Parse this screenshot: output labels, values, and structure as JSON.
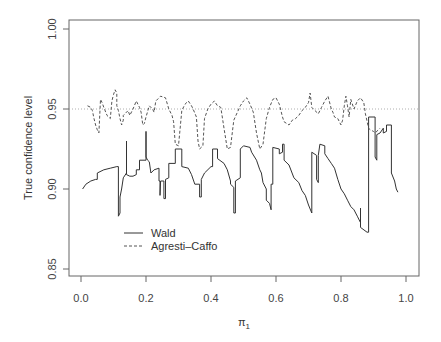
{
  "chart_data": {
    "type": "line",
    "title": "",
    "xlabel": "π1",
    "xlabel_main": "π",
    "xlabel_sub": "1",
    "ylabel": "True confidence level",
    "xlim": [
      0.0,
      1.0
    ],
    "ylim": [
      0.85,
      1.0
    ],
    "x_ticks": [
      "0.0",
      "0.2",
      "0.4",
      "0.6",
      "0.8",
      "1.0"
    ],
    "y_ticks": [
      "0.85",
      "0.90",
      "0.95",
      "1.00"
    ],
    "reference_line": {
      "y": 0.95,
      "style": "dotted"
    },
    "grid": false,
    "legend_position": "inside bottom-left",
    "legend": [
      {
        "label": "Wald",
        "style": "solid"
      },
      {
        "label": "Agresti–Caffo",
        "style": "dashed"
      }
    ],
    "series": [
      {
        "name": "Wald",
        "style": "solid",
        "color": "#333333",
        "points": [
          [
            0.005,
            0.9
          ],
          [
            0.015,
            0.903
          ],
          [
            0.03,
            0.905
          ],
          [
            0.045,
            0.906
          ],
          [
            0.05,
            0.906
          ],
          [
            0.05,
            0.91
          ],
          [
            0.07,
            0.912
          ],
          [
            0.09,
            0.913
          ],
          [
            0.11,
            0.914
          ],
          [
            0.115,
            0.914
          ],
          [
            0.115,
            0.883
          ],
          [
            0.12,
            0.885
          ],
          [
            0.12,
            0.895
          ],
          [
            0.125,
            0.9
          ],
          [
            0.13,
            0.907
          ],
          [
            0.14,
            0.91
          ],
          [
            0.14,
            0.93
          ],
          [
            0.14,
            0.909
          ],
          [
            0.15,
            0.908
          ],
          [
            0.16,
            0.908
          ],
          [
            0.17,
            0.909
          ],
          [
            0.17,
            0.912
          ],
          [
            0.18,
            0.912
          ],
          [
            0.18,
            0.918
          ],
          [
            0.2,
            0.918
          ],
          [
            0.2,
            0.936
          ],
          [
            0.2,
            0.92
          ],
          [
            0.205,
            0.918
          ],
          [
            0.21,
            0.917
          ],
          [
            0.215,
            0.91
          ],
          [
            0.225,
            0.912
          ],
          [
            0.24,
            0.913
          ],
          [
            0.24,
            0.905
          ],
          [
            0.243,
            0.905
          ],
          [
            0.243,
            0.896
          ],
          [
            0.245,
            0.905
          ],
          [
            0.255,
            0.905
          ],
          [
            0.255,
            0.894
          ],
          [
            0.26,
            0.894
          ],
          [
            0.26,
            0.906
          ],
          [
            0.27,
            0.907
          ],
          [
            0.27,
            0.916
          ],
          [
            0.29,
            0.916
          ],
          [
            0.29,
            0.925
          ],
          [
            0.31,
            0.925
          ],
          [
            0.31,
            0.914
          ],
          [
            0.33,
            0.913
          ],
          [
            0.34,
            0.909
          ],
          [
            0.35,
            0.903
          ],
          [
            0.365,
            0.903
          ],
          [
            0.365,
            0.895
          ],
          [
            0.37,
            0.895
          ],
          [
            0.37,
            0.906
          ],
          [
            0.38,
            0.91
          ],
          [
            0.4,
            0.914
          ],
          [
            0.405,
            0.914
          ],
          [
            0.405,
            0.925
          ],
          [
            0.42,
            0.925
          ],
          [
            0.42,
            0.919
          ],
          [
            0.44,
            0.916
          ],
          [
            0.45,
            0.912
          ],
          [
            0.46,
            0.905
          ],
          [
            0.46,
            0.903
          ],
          [
            0.47,
            0.901
          ],
          [
            0.47,
            0.885
          ],
          [
            0.475,
            0.885
          ],
          [
            0.475,
            0.905
          ],
          [
            0.49,
            0.907
          ],
          [
            0.49,
            0.925
          ],
          [
            0.5,
            0.927
          ],
          [
            0.52,
            0.926
          ],
          [
            0.525,
            0.923
          ],
          [
            0.54,
            0.918
          ],
          [
            0.55,
            0.912
          ],
          [
            0.555,
            0.91
          ],
          [
            0.56,
            0.904
          ],
          [
            0.57,
            0.9
          ],
          [
            0.57,
            0.893
          ],
          [
            0.58,
            0.891
          ],
          [
            0.585,
            0.887
          ],
          [
            0.585,
            0.903
          ],
          [
            0.59,
            0.903
          ],
          [
            0.59,
            0.926
          ],
          [
            0.61,
            0.925
          ],
          [
            0.61,
            0.922
          ],
          [
            0.62,
            0.923
          ],
          [
            0.62,
            0.928
          ],
          [
            0.625,
            0.928
          ],
          [
            0.625,
            0.918
          ],
          [
            0.64,
            0.915
          ],
          [
            0.655,
            0.907
          ],
          [
            0.67,
            0.904
          ],
          [
            0.68,
            0.899
          ],
          [
            0.69,
            0.896
          ],
          [
            0.7,
            0.89
          ],
          [
            0.71,
            0.885
          ],
          [
            0.71,
            0.923
          ],
          [
            0.725,
            0.921
          ],
          [
            0.725,
            0.906
          ],
          [
            0.73,
            0.904
          ],
          [
            0.73,
            0.921
          ],
          [
            0.735,
            0.928
          ],
          [
            0.75,
            0.927
          ],
          [
            0.75,
            0.922
          ],
          [
            0.76,
            0.919
          ],
          [
            0.77,
            0.916
          ],
          [
            0.78,
            0.913
          ],
          [
            0.79,
            0.906
          ],
          [
            0.8,
            0.9
          ],
          [
            0.81,
            0.897
          ],
          [
            0.82,
            0.893
          ],
          [
            0.83,
            0.889
          ],
          [
            0.84,
            0.887
          ],
          [
            0.85,
            0.883
          ],
          [
            0.86,
            0.879
          ],
          [
            0.86,
            0.888
          ],
          [
            0.86,
            0.876
          ],
          [
            0.88,
            0.873
          ],
          [
            0.885,
            0.873
          ],
          [
            0.885,
            0.945
          ],
          [
            0.905,
            0.945
          ],
          [
            0.905,
            0.92
          ],
          [
            0.91,
            0.918
          ],
          [
            0.91,
            0.934
          ],
          [
            0.92,
            0.935
          ],
          [
            0.93,
            0.938
          ],
          [
            0.93,
            0.935
          ],
          [
            0.94,
            0.936
          ],
          [
            0.94,
            0.94
          ],
          [
            0.955,
            0.94
          ],
          [
            0.955,
            0.91
          ],
          [
            0.965,
            0.905
          ],
          [
            0.97,
            0.9
          ],
          [
            0.975,
            0.898
          ]
        ]
      },
      {
        "name": "Agresti–Caffo",
        "style": "dashed",
        "color": "#555555",
        "points": [
          [
            0.02,
            0.952
          ],
          [
            0.03,
            0.951
          ],
          [
            0.035,
            0.949
          ],
          [
            0.04,
            0.944
          ],
          [
            0.045,
            0.94
          ],
          [
            0.05,
            0.937
          ],
          [
            0.055,
            0.935
          ],
          [
            0.06,
            0.956
          ],
          [
            0.065,
            0.954
          ],
          [
            0.07,
            0.951
          ],
          [
            0.08,
            0.946
          ],
          [
            0.09,
            0.944
          ],
          [
            0.095,
            0.955
          ],
          [
            0.1,
            0.959
          ],
          [
            0.105,
            0.962
          ],
          [
            0.11,
            0.96
          ],
          [
            0.11,
            0.952
          ],
          [
            0.115,
            0.949
          ],
          [
            0.12,
            0.944
          ],
          [
            0.125,
            0.94
          ],
          [
            0.13,
            0.943
          ],
          [
            0.13,
            0.946
          ],
          [
            0.14,
            0.948
          ],
          [
            0.145,
            0.949
          ],
          [
            0.15,
            0.946
          ],
          [
            0.16,
            0.95
          ],
          [
            0.17,
            0.955
          ],
          [
            0.18,
            0.951
          ],
          [
            0.185,
            0.948
          ],
          [
            0.19,
            0.94
          ],
          [
            0.195,
            0.941
          ],
          [
            0.2,
            0.945
          ],
          [
            0.21,
            0.952
          ],
          [
            0.22,
            0.95
          ],
          [
            0.225,
            0.948
          ],
          [
            0.23,
            0.955
          ],
          [
            0.245,
            0.958
          ],
          [
            0.26,
            0.957
          ],
          [
            0.27,
            0.95
          ],
          [
            0.28,
            0.946
          ],
          [
            0.285,
            0.942
          ],
          [
            0.29,
            0.928
          ],
          [
            0.3,
            0.927
          ],
          [
            0.31,
            0.949
          ],
          [
            0.32,
            0.953
          ],
          [
            0.33,
            0.955
          ],
          [
            0.34,
            0.952
          ],
          [
            0.345,
            0.95
          ],
          [
            0.355,
            0.945
          ],
          [
            0.36,
            0.93
          ],
          [
            0.365,
            0.925
          ],
          [
            0.375,
            0.927
          ],
          [
            0.38,
            0.944
          ],
          [
            0.39,
            0.95
          ],
          [
            0.4,
            0.953
          ],
          [
            0.41,
            0.955
          ],
          [
            0.42,
            0.952
          ],
          [
            0.43,
            0.951
          ],
          [
            0.44,
            0.938
          ],
          [
            0.45,
            0.925
          ],
          [
            0.46,
            0.926
          ],
          [
            0.47,
            0.943
          ],
          [
            0.49,
            0.952
          ],
          [
            0.5,
            0.955
          ],
          [
            0.51,
            0.957
          ],
          [
            0.52,
            0.953
          ],
          [
            0.53,
            0.948
          ],
          [
            0.54,
            0.935
          ],
          [
            0.55,
            0.925
          ],
          [
            0.56,
            0.928
          ],
          [
            0.57,
            0.944
          ],
          [
            0.58,
            0.951
          ],
          [
            0.59,
            0.956
          ],
          [
            0.6,
            0.957
          ],
          [
            0.61,
            0.953
          ],
          [
            0.62,
            0.945
          ],
          [
            0.625,
            0.942
          ],
          [
            0.64,
            0.94
          ],
          [
            0.65,
            0.943
          ],
          [
            0.66,
            0.944
          ],
          [
            0.67,
            0.946
          ],
          [
            0.68,
            0.949
          ],
          [
            0.69,
            0.951
          ],
          [
            0.7,
            0.954
          ],
          [
            0.705,
            0.96
          ],
          [
            0.71,
            0.951
          ],
          [
            0.72,
            0.949
          ],
          [
            0.73,
            0.947
          ],
          [
            0.74,
            0.951
          ],
          [
            0.75,
            0.955
          ],
          [
            0.76,
            0.958
          ],
          [
            0.77,
            0.95
          ],
          [
            0.775,
            0.948
          ],
          [
            0.78,
            0.945
          ],
          [
            0.79,
            0.944
          ],
          [
            0.8,
            0.94
          ],
          [
            0.805,
            0.943
          ],
          [
            0.81,
            0.952
          ],
          [
            0.815,
            0.958
          ],
          [
            0.82,
            0.952
          ],
          [
            0.825,
            0.945
          ],
          [
            0.83,
            0.956
          ],
          [
            0.84,
            0.95
          ],
          [
            0.85,
            0.955
          ],
          [
            0.86,
            0.957
          ],
          [
            0.87,
            0.954
          ],
          [
            0.875,
            0.947
          ],
          [
            0.885,
            0.938
          ],
          [
            0.89,
            0.937
          ],
          [
            0.9,
            0.936
          ],
          [
            0.905,
            0.935
          ],
          [
            0.915,
            0.937
          ],
          [
            0.92,
            0.938
          ]
        ]
      }
    ]
  },
  "plot": {
    "ylabel": "True confidence level",
    "xlabel_main": "π",
    "xlabel_sub": "1",
    "legend_wald": "Wald",
    "legend_ac": "Agresti–Caffo"
  }
}
